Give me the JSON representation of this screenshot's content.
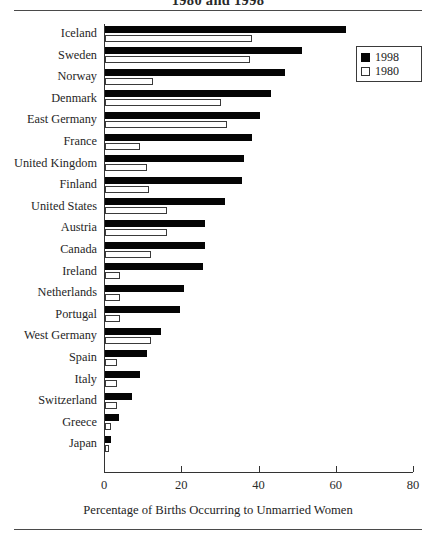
{
  "figure": {
    "title": "1980 and 1998",
    "xaxis_title": "Percentage of Births Occurring to Unmarried Women"
  },
  "legend": {
    "position": "top-right",
    "entries": [
      {
        "label": "1998",
        "swatch": "filled-black-square",
        "color": "#050505"
      },
      {
        "label": "1980",
        "swatch": "open-white-square",
        "color": "#ffffff"
      }
    ]
  },
  "axis": {
    "ticks": [
      {
        "label": "0",
        "value": 0
      },
      {
        "label": "20",
        "value": 20
      },
      {
        "label": "40",
        "value": 40
      },
      {
        "label": "60",
        "value": 60
      },
      {
        "label": "80",
        "value": 80
      }
    ]
  },
  "chart_data": {
    "type": "bar",
    "orientation": "horizontal",
    "title": "1980 and 1998",
    "xlabel": "Percentage of Births Occurring to Unmarried Women",
    "ylabel": "",
    "xlim": [
      0,
      80
    ],
    "grid": false,
    "legend_position": "top-right",
    "categories": [
      "Iceland",
      "Sweden",
      "Norway",
      "Denmark",
      "East Germany",
      "France",
      "United Kingdom",
      "Finland",
      "United States",
      "Austria",
      "Canada",
      "Ireland",
      "Netherlands",
      "Portugal",
      "West Germany",
      "Spain",
      "Italy",
      "Switzerland",
      "Greece",
      "Japan"
    ],
    "series": [
      {
        "name": "1998",
        "color": "#050505",
        "values": [
          62.5,
          51.0,
          46.5,
          43.0,
          40.0,
          38.0,
          36.0,
          35.5,
          31.0,
          26.0,
          26.0,
          25.5,
          20.5,
          19.5,
          14.5,
          11.0,
          9.0,
          7.0,
          3.5,
          1.5
        ]
      },
      {
        "name": "1980",
        "color": "#ffffff",
        "values": [
          38.0,
          37.5,
          12.5,
          30.0,
          31.5,
          9.0,
          11.0,
          11.5,
          16.0,
          16.0,
          12.0,
          4.0,
          4.0,
          4.0,
          12.0,
          3.0,
          3.0,
          3.0,
          1.5,
          1.0
        ]
      }
    ]
  }
}
